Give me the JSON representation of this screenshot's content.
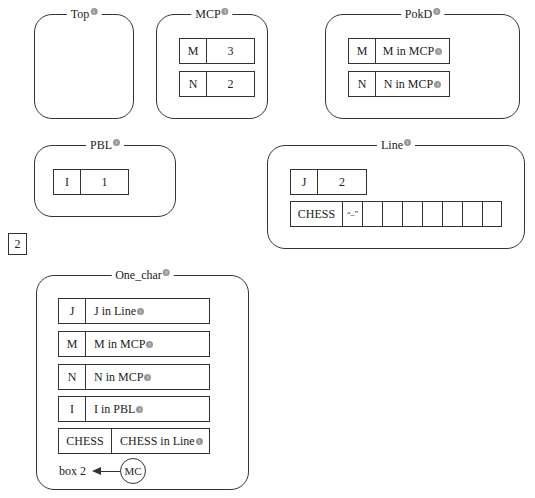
{
  "frames": {
    "top": {
      "title": "Top",
      "marker": "1"
    },
    "mcp": {
      "title": "MCP",
      "marker": "1",
      "rows": [
        {
          "name": "M",
          "value": "3"
        },
        {
          "name": "N",
          "value": "2"
        }
      ]
    },
    "pokd": {
      "title": "PokD",
      "marker": "1",
      "rows": [
        {
          "name": "M",
          "value": "M in MCP",
          "marker": "1"
        },
        {
          "name": "N",
          "value": "N in MCP",
          "marker": "1"
        }
      ]
    },
    "pbl": {
      "title": "PBL",
      "marker": "1",
      "rows": [
        {
          "name": "I",
          "value": "1"
        }
      ]
    },
    "line": {
      "title": "Line",
      "marker": "1",
      "j_row": {
        "name": "J",
        "value": "2"
      },
      "chess_row": {
        "name": "CHESS",
        "cells": [
          "“–”",
          "",
          "",
          "",
          "",
          "",
          "",
          ""
        ]
      }
    },
    "one_char": {
      "title": "One_char",
      "marker": "2",
      "rows": [
        {
          "name": "J",
          "value": "J in Line",
          "marker": "1"
        },
        {
          "name": "M",
          "value": "M in MCP",
          "marker": "1"
        },
        {
          "name": "N",
          "value": "N in MCP",
          "marker": "1"
        },
        {
          "name": "I",
          "value": "I in PBL",
          "marker": "1"
        },
        {
          "name": "CHESS",
          "value": "CHESS in Line",
          "marker": "1"
        }
      ],
      "link": {
        "label": "box 2",
        "circle": "MC"
      }
    }
  },
  "standalone_box": {
    "value": "2"
  }
}
